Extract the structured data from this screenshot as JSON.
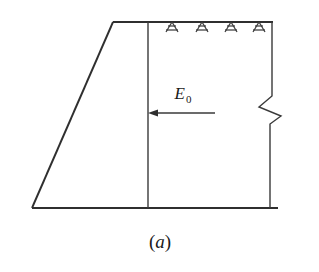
{
  "figure": {
    "caption": "(a)",
    "caption_paren_open": "(",
    "caption_letter": "a",
    "caption_paren_close": ")",
    "background_color": "#ffffff",
    "line_color": "#2f2f2f",
    "label_color": "#1a1a1a"
  },
  "labels": {
    "force": {
      "symbol": "E",
      "subscript": "0",
      "full": "E0",
      "meaning": "at-rest-earth-pressure-resultant"
    }
  },
  "geometry": {
    "wall_top_left": {
      "x": 113,
      "y": 22
    },
    "wall_bottom_left": {
      "x": 32,
      "y": 208
    },
    "inner_vertical_x": 148,
    "right_vertical_x": 272,
    "base_left_x": 32,
    "base_right_x": 278,
    "base_y": 208,
    "top_y": 22,
    "top_right_x": 273
  },
  "elements": {
    "sloped_face_name": "wall-sloped-back-face",
    "inner_line_name": "wall-inner-vertical-face",
    "base_line_name": "wall-base-line",
    "top_line_name": "ground-surface-line",
    "right_line_name": "soil-right-boundary",
    "break_symbol_name": "break-line-zigzag",
    "anchor_count": 4,
    "anchor_label": "ground-surface-hatch"
  },
  "anchors": {
    "positions_x": [
      172,
      202,
      231,
      259
    ],
    "base_y": 22,
    "size": 9
  },
  "arrow": {
    "tip_x": 148,
    "tail_x": 215,
    "y": 113,
    "direction": "left",
    "label_x": 183,
    "label_y": 99
  }
}
